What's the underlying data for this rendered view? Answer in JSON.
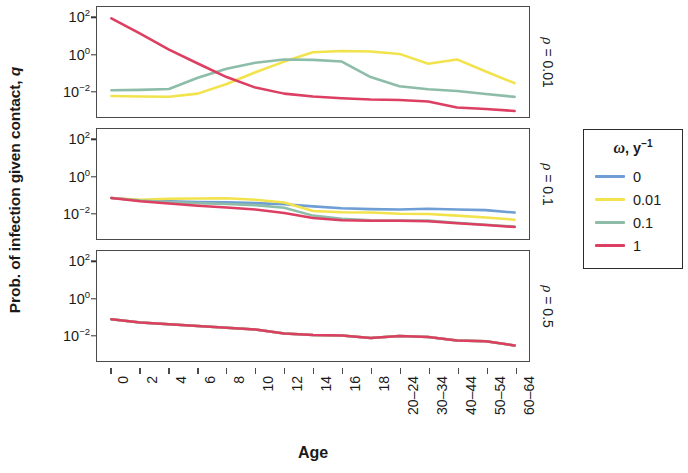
{
  "axes": {
    "ylabel_prefix": "Prob. of infection given contact, ",
    "ylabel_italic": "q",
    "xlabel": "Age"
  },
  "legend": {
    "title_symbol": "ω",
    "title_rest": ", y",
    "title_sup": "−1",
    "entries": [
      {
        "label": "0",
        "color": "#6e9ed4"
      },
      {
        "label": "0.01",
        "color": "#f2e34d"
      },
      {
        "label": "0.1",
        "color": "#8dbda9"
      },
      {
        "label": "1",
        "color": "#dd3f62"
      }
    ]
  },
  "strips": [
    {
      "symbol": "ρ",
      "text": " = 0.01"
    },
    {
      "symbol": "ρ",
      "text": " = 0.1"
    },
    {
      "symbol": "ρ",
      "text": " = 0.5"
    }
  ],
  "chart_data": {
    "type": "line",
    "title": "",
    "xlabel": "Age",
    "ylabel": "Prob. of infection given contact, q",
    "yscale": "log10",
    "ylim": [
      -3.4,
      2.6
    ],
    "ytick_labels": [
      "10",
      "10",
      "10"
    ],
    "ytick_sups": [
      "2",
      "0",
      "−2"
    ],
    "ytick_values": [
      2,
      0,
      -2
    ],
    "grid": false,
    "legend_position": "right",
    "legend_title": "ω, y⁻¹",
    "categories": [
      "0",
      "2",
      "4",
      "6",
      "8",
      "10",
      "12",
      "14",
      "16",
      "18",
      "20–24",
      "30–34",
      "40–44",
      "50–54",
      "60–64"
    ],
    "panels": [
      {
        "facet_label": "ρ = 0.01",
        "series": [
          {
            "name": "0",
            "color": "#6e9ed4",
            "values": [
              null,
              null,
              null,
              null,
              null,
              null,
              null,
              null,
              null,
              null,
              null,
              null,
              null,
              null,
              null
            ]
          },
          {
            "name": "0.01",
            "color": "#f2e34d",
            "values": [
              0.0055,
              0.0052,
              0.0051,
              0.0075,
              0.025,
              0.11,
              0.42,
              1.35,
              1.6,
              1.5,
              1.1,
              0.32,
              0.55,
              0.12,
              0.028
            ]
          },
          {
            "name": "0.1",
            "color": "#8dbda9",
            "values": [
              0.0115,
              0.012,
              0.0135,
              0.055,
              0.17,
              0.36,
              0.55,
              0.52,
              0.42,
              0.06,
              0.019,
              0.013,
              0.0105,
              0.0072,
              0.005
            ]
          },
          {
            "name": "1",
            "color": "#dd3f62",
            "values": [
              95,
              14,
              1.9,
              0.33,
              0.06,
              0.016,
              0.0075,
              0.0052,
              0.0042,
              0.0036,
              0.0034,
              0.0028,
              0.0013,
              0.0011,
              0.00085
            ]
          }
        ]
      },
      {
        "facet_label": "ρ = 0.1",
        "series": [
          {
            "name": "0",
            "color": "#6e9ed4",
            "values": [
              0.068,
              0.052,
              0.045,
              0.042,
              0.04,
              0.036,
              0.031,
              0.024,
              0.019,
              0.017,
              0.016,
              0.018,
              0.016,
              0.015,
              0.011
            ]
          },
          {
            "name": "0.01",
            "color": "#f2e34d",
            "values": [
              0.068,
              0.055,
              0.062,
              0.065,
              0.066,
              0.055,
              0.039,
              0.0135,
              0.0115,
              0.011,
              0.0095,
              0.0092,
              0.0075,
              0.006,
              0.0045
            ]
          },
          {
            "name": "0.1",
            "color": "#8dbda9",
            "values": [
              0.068,
              0.05,
              0.042,
              0.036,
              0.032,
              0.028,
              0.02,
              0.0075,
              0.005,
              0.0042,
              0.0041,
              0.004,
              0.0031,
              0.0024,
              0.0019
            ]
          },
          {
            "name": "1",
            "color": "#dd3f62",
            "values": [
              0.068,
              0.046,
              0.034,
              0.026,
              0.021,
              0.016,
              0.0105,
              0.0055,
              0.0042,
              0.0039,
              0.0039,
              0.0037,
              0.0029,
              0.0023,
              0.0018
            ]
          }
        ]
      },
      {
        "facet_label": "ρ = 0.5",
        "series": [
          {
            "name": "0",
            "color": "#6e9ed4",
            "values": [
              0.075,
              0.05,
              0.04,
              0.032,
              0.026,
              0.021,
              0.0125,
              0.0105,
              0.0098,
              0.0072,
              0.0092,
              0.0082,
              0.0052,
              0.0048,
              0.0028
            ]
          },
          {
            "name": "0.01",
            "color": "#f2e34d",
            "values": [
              0.075,
              0.05,
              0.04,
              0.032,
              0.026,
              0.021,
              0.0125,
              0.0105,
              0.0098,
              0.0072,
              0.0092,
              0.0082,
              0.0052,
              0.0048,
              0.0028
            ]
          },
          {
            "name": "0.1",
            "color": "#8dbda9",
            "values": [
              0.075,
              0.05,
              0.04,
              0.032,
              0.026,
              0.021,
              0.0125,
              0.0105,
              0.0098,
              0.0072,
              0.0092,
              0.0082,
              0.0052,
              0.0048,
              0.0028
            ]
          },
          {
            "name": "1",
            "color": "#dd3f62",
            "values": [
              0.075,
              0.05,
              0.04,
              0.032,
              0.026,
              0.021,
              0.0125,
              0.0105,
              0.0098,
              0.0072,
              0.0092,
              0.0082,
              0.0052,
              0.0048,
              0.0028
            ]
          }
        ]
      }
    ]
  }
}
